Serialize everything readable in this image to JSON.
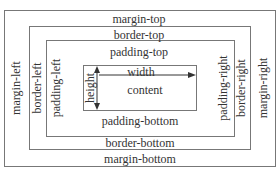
{
  "diagram": {
    "margin": {
      "top": "margin-top",
      "bottom": "margin-bottom",
      "left": "margin-left",
      "right": "margin-right"
    },
    "border": {
      "top": "border-top",
      "bottom": "border-bottom",
      "left": "border-left",
      "right": "border-right"
    },
    "padding": {
      "top": "padding-top",
      "bottom": "padding-bottom",
      "left": "padding-left",
      "right": "padding-right"
    },
    "content": {
      "label": "content",
      "width_label": "width",
      "height_label": "height"
    }
  }
}
